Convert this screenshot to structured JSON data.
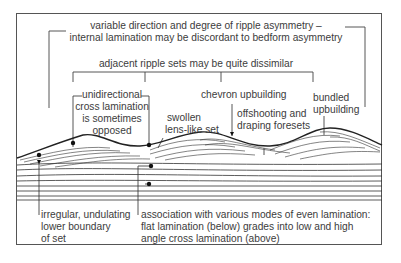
{
  "diagram": {
    "type": "ripple cross-lamination sedimentary structure",
    "labels": {
      "top_line1": "variable direction and degree of ripple asymmetry –",
      "top_line2": "internal lamination may be discordant to bedform asymmetry",
      "adjacent": "adjacent ripple sets may be quite dissimilar",
      "unidirectional_1": "unidirectional",
      "unidirectional_2": "cross lamination",
      "unidirectional_3": "is sometimes",
      "unidirectional_4": "opposed",
      "swollen_1": "swollen",
      "swollen_2": "lens-like set",
      "chevron": "chevron upbuilding",
      "offshooting_1": "offshooting and",
      "offshooting_2": "draping foresets",
      "bundled_1": "bundled",
      "bundled_2": "upbuilding",
      "irregular_1": "irregular, undulating",
      "irregular_2": "lower boundary",
      "irregular_3": "of set",
      "association_1": "association with various modes of even lamination:",
      "association_2": "flat lamination (below) grades into low and high",
      "association_3": "angle cross lamination (above)"
    }
  }
}
